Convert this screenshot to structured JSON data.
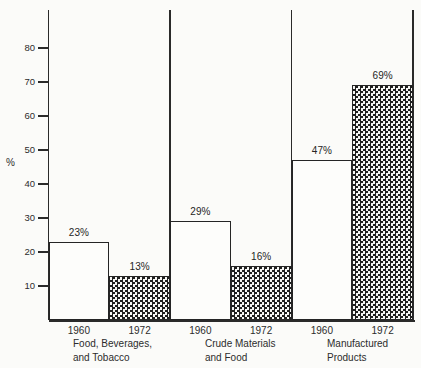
{
  "figure": {
    "ylabel": "%"
  },
  "colors": {
    "background": "#fbfbf9",
    "line": "#2a2a2a",
    "text": "#2c2c2c",
    "pattern_fill": "#1e1e1e"
  },
  "groups": [
    {
      "label_lines": [
        "Food, Beverages,",
        "and Tobacco"
      ],
      "bars": [
        {
          "year": "1960",
          "value": 23,
          "value_label": "23%",
          "fill": "plain"
        },
        {
          "year": "1972",
          "value": 13,
          "value_label": "13%",
          "fill": "crosshatch"
        }
      ]
    },
    {
      "label_lines": [
        "Crude Materials",
        "and Food"
      ],
      "bars": [
        {
          "year": "1960",
          "value": 29,
          "value_label": "29%",
          "fill": "plain"
        },
        {
          "year": "1972",
          "value": 16,
          "value_label": "16%",
          "fill": "crosshatch"
        }
      ]
    },
    {
      "label_lines": [
        "Manufactured",
        "Products"
      ],
      "bars": [
        {
          "year": "1960",
          "value": 47,
          "value_label": "47%",
          "fill": "plain"
        },
        {
          "year": "1972",
          "value": 69,
          "value_label": "69%",
          "fill": "crosshatch"
        }
      ]
    }
  ],
  "chart_data": {
    "type": "bar",
    "categories": [
      "Food, Beverages, and Tobacco",
      "Crude Materials and Food",
      "Manufactured Products"
    ],
    "series": [
      {
        "name": "1960",
        "values": [
          23,
          29,
          47
        ],
        "fill": "plain white, black outline"
      },
      {
        "name": "1972",
        "values": [
          13,
          16,
          69
        ],
        "fill": "black crosshatch pattern"
      }
    ],
    "title": "",
    "xlabel": "",
    "ylabel": "%",
    "ylim": [
      0,
      90
    ],
    "yticks": [
      10,
      20,
      30,
      40,
      50,
      60,
      70,
      80
    ],
    "grid": false,
    "legend": "none",
    "data_labels": "percentage shown above each bar",
    "group_separators": true
  }
}
